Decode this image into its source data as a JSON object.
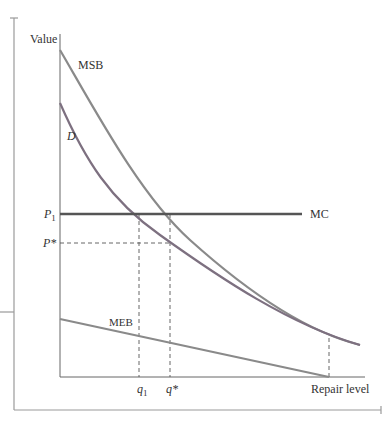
{
  "diagram": {
    "type": "economics-curve-diagram",
    "y_axis_label": "Value",
    "x_axis_label": "Repair level",
    "curves": [
      {
        "name": "MSB",
        "label": "MSB",
        "color": "#8a8a8a"
      },
      {
        "name": "D",
        "label": "D",
        "color": "#7d7080"
      },
      {
        "name": "MC",
        "label": "MC",
        "color": "#555555"
      },
      {
        "name": "MEB",
        "label": "MEB",
        "color": "#8a8a8a"
      }
    ],
    "y_ticks": [
      {
        "label": "P",
        "sub": "1"
      },
      {
        "label": "P*",
        "sub": ""
      }
    ],
    "x_ticks": [
      {
        "label": "q",
        "sub": "1"
      },
      {
        "label": "q*",
        "sub": ""
      }
    ]
  },
  "labels": {
    "value": "Value",
    "repair_level": "Repair level",
    "msb": "MSB",
    "d": "D",
    "mc": "MC",
    "meb": "MEB",
    "p1_main": "P",
    "p1_sub": "1",
    "pstar": "P*",
    "q1_main": "q",
    "q1_sub": "1",
    "qstar": "q*"
  }
}
